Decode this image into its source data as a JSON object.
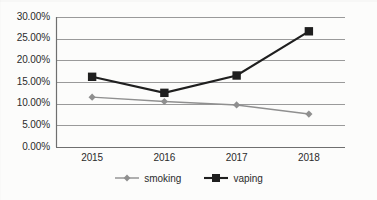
{
  "chart_data": {
    "type": "line",
    "title": "",
    "subtitle": "",
    "xlabel": "",
    "ylabel": "",
    "categories": [
      "2015",
      "2016",
      "2017",
      "2018"
    ],
    "series": [
      {
        "name": "smoking",
        "values": [
          11.5,
          10.5,
          9.7,
          7.6
        ],
        "color": "#8f8f8f",
        "marker": "diamond"
      },
      {
        "name": "vaping",
        "values": [
          16.2,
          12.5,
          16.5,
          26.7
        ],
        "color": "#1f1f1f",
        "marker": "square"
      }
    ],
    "ylim": [
      0,
      30
    ],
    "ytick_labels": [
      "0.00%",
      "5.00%",
      "10.00%",
      "15.00%",
      "20.00%",
      "25.00%",
      "30.00%"
    ],
    "ytick_values": [
      0,
      5,
      10,
      15,
      20,
      25,
      30
    ],
    "grid": true,
    "grid_color": "#9a9a9a",
    "legend_position": "bottom",
    "value_suffix": "%"
  },
  "legend": {
    "items": [
      {
        "label": "smoking",
        "marker": "diamond-marker-icon",
        "color": "#8f8f8f"
      },
      {
        "label": "vaping",
        "marker": "square-marker-icon",
        "color": "#1f1f1f"
      }
    ]
  }
}
